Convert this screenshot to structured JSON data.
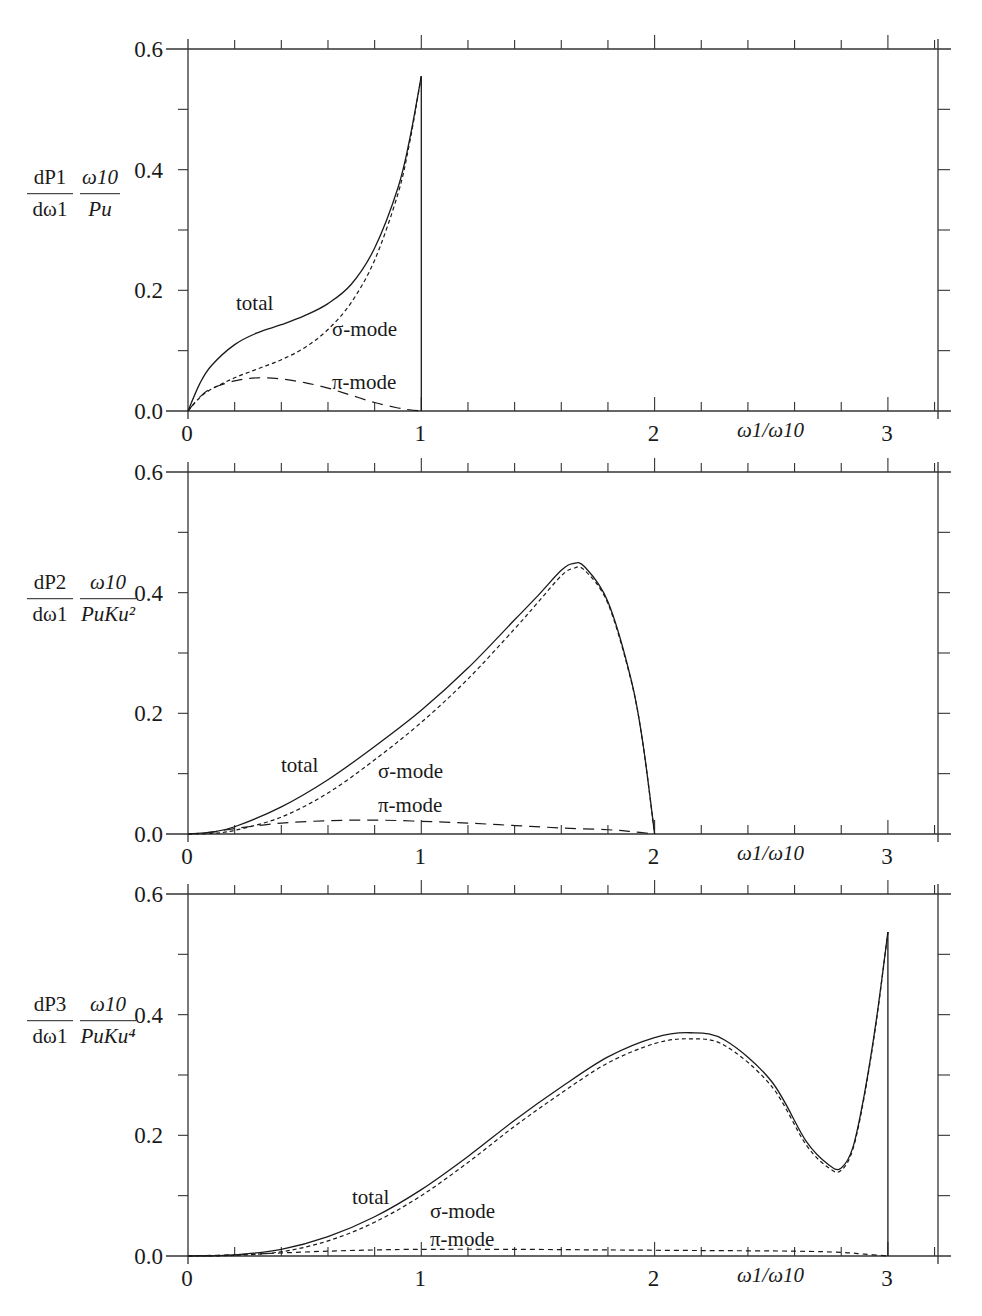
{
  "figure": {
    "x_axis_label": "ω1/ω10",
    "x_ticks": [
      "0",
      "1",
      "2",
      "3"
    ],
    "y_ticks": [
      "0.0",
      "0.2",
      "0.4",
      "0.6"
    ]
  },
  "panels": [
    {
      "y_label": {
        "num_left": "dP1",
        "den_left": "dω1",
        "num_right": "ω10",
        "den_right": "Pu"
      },
      "labels": {
        "total": "total",
        "sigma": "σ-mode",
        "pi": "π-mode"
      }
    },
    {
      "y_label": {
        "num_left": "dP2",
        "den_left": "dω1",
        "num_right": "ω10",
        "den_right": "PuKu²"
      },
      "labels": {
        "total": "total",
        "sigma": "σ-mode",
        "pi": "π-mode"
      }
    },
    {
      "y_label": {
        "num_left": "dP3",
        "den_left": "dω1",
        "num_right": "ω10",
        "den_right": "PuKu⁴"
      },
      "labels": {
        "total": "total",
        "sigma": "σ-mode",
        "pi": "π-mode"
      }
    }
  ],
  "chart_data": [
    {
      "type": "line",
      "title": "",
      "xlabel": "ω1/ω10",
      "ylabel": "(dP1/dω1)(ω10/Pu)",
      "xlim": [
        0,
        3.21
      ],
      "ylim": [
        0,
        0.6
      ],
      "x_ticks": [
        0,
        1,
        2,
        3
      ],
      "y_ticks": [
        0.0,
        0.2,
        0.4,
        0.6
      ],
      "grid": false,
      "legend": "inline labels",
      "series": [
        {
          "name": "total",
          "style": "solid",
          "x": [
            0,
            0.05,
            0.1,
            0.2,
            0.3,
            0.4,
            0.5,
            0.6,
            0.7,
            0.8,
            0.9,
            0.95,
            1.0
          ],
          "y": [
            0,
            0.045,
            0.075,
            0.11,
            0.13,
            0.143,
            0.158,
            0.178,
            0.21,
            0.27,
            0.37,
            0.45,
            0.555
          ]
        },
        {
          "name": "σ-mode",
          "style": "short-dash",
          "x": [
            0,
            0.05,
            0.1,
            0.2,
            0.3,
            0.4,
            0.5,
            0.6,
            0.7,
            0.8,
            0.9,
            0.95,
            1.0
          ],
          "y": [
            0,
            0.022,
            0.036,
            0.055,
            0.07,
            0.085,
            0.105,
            0.135,
            0.18,
            0.25,
            0.36,
            0.445,
            0.555
          ]
        },
        {
          "name": "π-mode",
          "style": "long-dash",
          "x": [
            0,
            0.05,
            0.1,
            0.2,
            0.3,
            0.4,
            0.5,
            0.6,
            0.7,
            0.8,
            0.9,
            0.95,
            1.0
          ],
          "y": [
            0,
            0.023,
            0.037,
            0.05,
            0.055,
            0.053,
            0.047,
            0.038,
            0.026,
            0.014,
            0.005,
            0.002,
            0
          ]
        }
      ]
    },
    {
      "type": "line",
      "title": "",
      "xlabel": "ω1/ω10",
      "ylabel": "(dP2/dω1)(ω10/(Pu Ku²))",
      "xlim": [
        0,
        3.21
      ],
      "ylim": [
        0,
        0.6
      ],
      "x_ticks": [
        0,
        1,
        2,
        3
      ],
      "y_ticks": [
        0.0,
        0.2,
        0.4,
        0.6
      ],
      "grid": false,
      "legend": "inline labels",
      "series": [
        {
          "name": "total",
          "style": "solid",
          "x": [
            0,
            0.1,
            0.2,
            0.4,
            0.6,
            0.8,
            1.0,
            1.2,
            1.4,
            1.5,
            1.6,
            1.65,
            1.7,
            1.8,
            1.9,
            1.95,
            2.0
          ],
          "y": [
            0,
            0.003,
            0.012,
            0.045,
            0.09,
            0.145,
            0.205,
            0.275,
            0.355,
            0.395,
            0.437,
            0.448,
            0.443,
            0.385,
            0.255,
            0.15,
            0
          ]
        },
        {
          "name": "σ-mode",
          "style": "short-dash",
          "x": [
            0,
            0.1,
            0.2,
            0.4,
            0.6,
            0.8,
            1.0,
            1.2,
            1.4,
            1.5,
            1.6,
            1.65,
            1.7,
            1.8,
            1.9,
            1.95,
            2.0
          ],
          "y": [
            0,
            0.001,
            0.006,
            0.028,
            0.068,
            0.123,
            0.185,
            0.257,
            0.34,
            0.384,
            0.428,
            0.44,
            0.437,
            0.382,
            0.253,
            0.149,
            0
          ]
        },
        {
          "name": "π-mode",
          "style": "long-dash",
          "x": [
            0,
            0.1,
            0.2,
            0.4,
            0.6,
            0.8,
            1.0,
            1.2,
            1.4,
            1.6,
            1.8,
            1.9,
            2.0
          ],
          "y": [
            0,
            0.003,
            0.009,
            0.018,
            0.022,
            0.023,
            0.021,
            0.018,
            0.014,
            0.01,
            0.007,
            0.004,
            0
          ]
        }
      ]
    },
    {
      "type": "line",
      "title": "",
      "xlabel": "ω1/ω10",
      "ylabel": "(dP3/dω1)(ω10/(Pu Ku⁴))",
      "xlim": [
        0,
        3.21
      ],
      "ylim": [
        0,
        0.6
      ],
      "x_ticks": [
        0,
        1,
        2,
        3
      ],
      "y_ticks": [
        0.0,
        0.2,
        0.4,
        0.6
      ],
      "grid": false,
      "legend": "inline labels",
      "series": [
        {
          "name": "total",
          "style": "solid",
          "x": [
            0,
            0.2,
            0.4,
            0.6,
            0.8,
            1.0,
            1.2,
            1.4,
            1.6,
            1.8,
            2.0,
            2.15,
            2.3,
            2.5,
            2.65,
            2.75,
            2.8,
            2.85,
            2.9,
            2.95,
            3.0
          ],
          "y": [
            0,
            0.002,
            0.011,
            0.032,
            0.065,
            0.11,
            0.165,
            0.225,
            0.28,
            0.33,
            0.362,
            0.37,
            0.358,
            0.29,
            0.19,
            0.15,
            0.146,
            0.18,
            0.27,
            0.39,
            0.537
          ]
        },
        {
          "name": "σ-mode",
          "style": "short-dash",
          "x": [
            0,
            0.2,
            0.4,
            0.6,
            0.8,
            1.0,
            1.2,
            1.4,
            1.6,
            1.8,
            2.0,
            2.15,
            2.3,
            2.5,
            2.65,
            2.75,
            2.8,
            2.85,
            2.9,
            2.95,
            3.0
          ],
          "y": [
            0,
            0.001,
            0.007,
            0.025,
            0.056,
            0.1,
            0.155,
            0.215,
            0.27,
            0.32,
            0.352,
            0.36,
            0.349,
            0.282,
            0.184,
            0.145,
            0.142,
            0.177,
            0.267,
            0.388,
            0.537
          ]
        },
        {
          "name": "π-mode",
          "style": "short-dash",
          "x": [
            0,
            0.2,
            0.4,
            0.6,
            0.8,
            1.0,
            1.4,
            1.8,
            2.2,
            2.6,
            2.8,
            2.9,
            3.0
          ],
          "y": [
            0,
            0.002,
            0.005,
            0.008,
            0.01,
            0.011,
            0.011,
            0.01,
            0.009,
            0.008,
            0.006,
            0.003,
            0
          ]
        }
      ]
    }
  ]
}
